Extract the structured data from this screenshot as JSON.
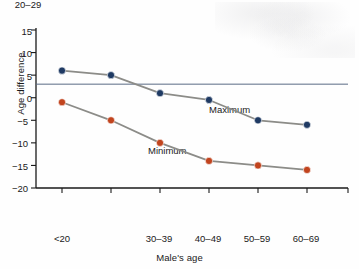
{
  "chart_data": {
    "type": "line",
    "title": "",
    "xlabel": "Male's age",
    "ylabel": "Age difference",
    "categories": [
      "<20",
      "20–29",
      "30–39",
      "40–49",
      "50–59",
      "60–69"
    ],
    "series": [
      {
        "name": "Maximum",
        "color": "#1f3a63",
        "values": [
          6,
          5,
          1,
          -0.5,
          -5,
          -6
        ]
      },
      {
        "name": "Minimum",
        "color": "#c1441e",
        "values": [
          -1,
          -5,
          -10,
          -14,
          -15,
          -16
        ]
      }
    ],
    "ylim": [
      -20,
      15
    ],
    "yticks": [
      15,
      10,
      5,
      0,
      -5,
      -10,
      -15,
      -20
    ],
    "ytick_labels": [
      "15",
      "10",
      "5",
      "0",
      "−5",
      "−10",
      "−15",
      "−20"
    ],
    "grid": false,
    "legend_position": "inline-annotations",
    "annotations": [
      {
        "text": "Maximum",
        "x_category": "40–49",
        "y": -0.5
      },
      {
        "text": "Minimum",
        "x_category": "30–39",
        "y": -7.5
      }
    ],
    "reference_line": {
      "value": 3,
      "orientation": "horizontal",
      "color": "#5a6b85"
    },
    "line_color": "#8c8c88",
    "background_color": "#fefefe",
    "axis_color": "#1a1a1a"
  },
  "labels": {
    "ylabel": "Age difference",
    "xlabel": "Male's age",
    "series_max": "Maximum",
    "series_min": "Minimum",
    "y0": "15",
    "y1": "10",
    "y2": "5",
    "y3": "0",
    "y4": "−5",
    "y5": "−10",
    "y6": "−15",
    "y7": "−20",
    "x0": "<20",
    "x1": "20–29",
    "x2": "30–39",
    "x3": "40–49",
    "x4": "50–59",
    "x5": "60–69"
  }
}
